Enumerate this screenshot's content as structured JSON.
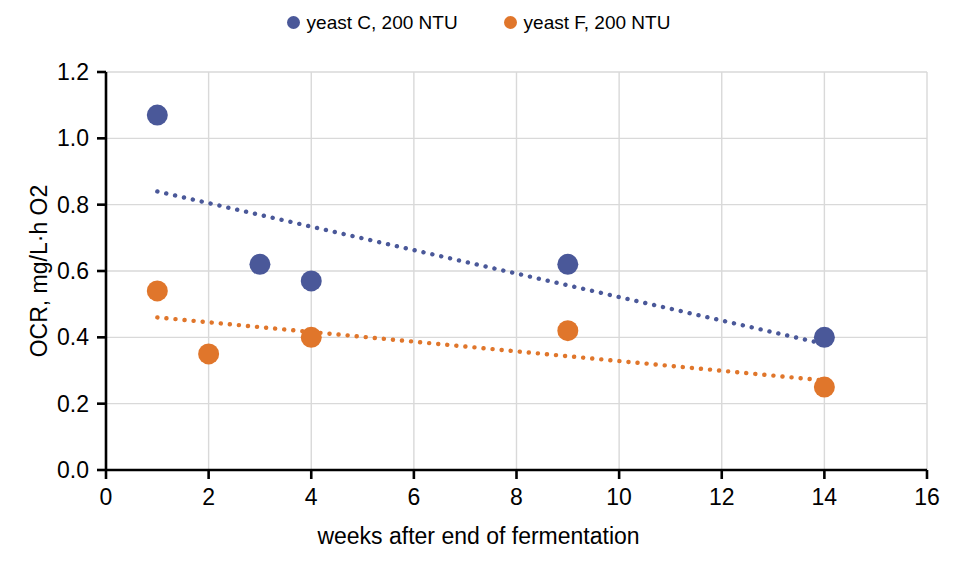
{
  "chart_data": {
    "type": "scatter",
    "title": "",
    "xlabel": "weeks after end of fermentation",
    "ylabel": "OCR, mg/L·h O2",
    "xlim": [
      0,
      16
    ],
    "ylim": [
      0.0,
      1.2
    ],
    "xticks": [
      "0",
      "2",
      "4",
      "6",
      "8",
      "10",
      "12",
      "14",
      "16"
    ],
    "yticks": [
      "0.0",
      "0.2",
      "0.4",
      "0.6",
      "0.8",
      "1.0",
      "1.2"
    ],
    "xtick_values": [
      0,
      2,
      4,
      6,
      8,
      10,
      12,
      14,
      16
    ],
    "ytick_values": [
      0.0,
      0.2,
      0.4,
      0.6,
      0.8,
      1.0,
      1.2
    ],
    "grid": "horizontal-and-vertical",
    "legend_position": "top-center",
    "series": [
      {
        "name": "yeast C, 200 NTU",
        "color": "#4A5899",
        "marker": "circle",
        "x": [
          1,
          3,
          4,
          9,
          14
        ],
        "y": [
          1.07,
          0.62,
          0.57,
          0.62,
          0.4
        ],
        "trendline": {
          "style": "dotted",
          "color": "#4A5899",
          "x": [
            1,
            14
          ],
          "y": [
            0.84,
            0.38
          ]
        }
      },
      {
        "name": "yeast F, 200 NTU",
        "color": "#E0762B",
        "marker": "circle",
        "x": [
          1,
          2,
          4,
          9,
          14
        ],
        "y": [
          0.54,
          0.35,
          0.4,
          0.42,
          0.25
        ],
        "trendline": {
          "style": "dotted",
          "color": "#E0762B",
          "x": [
            1,
            14
          ],
          "y": [
            0.46,
            0.27
          ]
        }
      }
    ]
  },
  "legend": {
    "entries": [
      {
        "label": "yeast C, 200 NTU",
        "color": "#4A5899"
      },
      {
        "label": "yeast F, 200 NTU",
        "color": "#E0762B"
      }
    ]
  },
  "axes": {
    "y_title": "OCR, mg/L·h O2",
    "x_title": "weeks after end of fermentation",
    "y_tick_labels": [
      "1.2",
      "1.0",
      "0.8",
      "0.6",
      "0.4",
      "0.2",
      "0.0"
    ],
    "x_tick_labels": [
      "0",
      "2",
      "4",
      "6",
      "8",
      "10",
      "12",
      "14",
      "16"
    ]
  },
  "colors": {
    "series_blue": "#4A5899",
    "series_orange": "#E0762B",
    "grid": "#D9D9D9",
    "axis": "#000000",
    "background": "#FFFFFF"
  }
}
